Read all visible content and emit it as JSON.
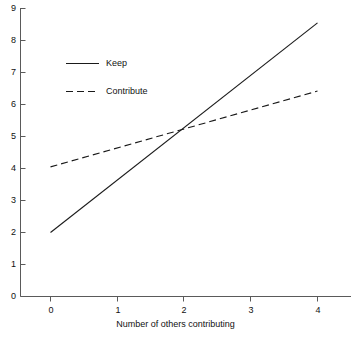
{
  "chart_data": {
    "type": "line",
    "title": "",
    "subtitle": "",
    "xlabel": "Number of others contributing",
    "ylabel": "",
    "x": [
      0,
      1,
      2,
      3,
      4
    ],
    "xlim": [
      -0.35,
      4.35
    ],
    "ylim": [
      0,
      9
    ],
    "xticks": [
      "0",
      "1",
      "2",
      "3",
      "4"
    ],
    "yticks": [
      "0",
      "1",
      "2",
      "3",
      "4",
      "5",
      "6",
      "7",
      "8",
      "9"
    ],
    "grid": false,
    "legend_position": "upper left",
    "series": [
      {
        "name": "Keep",
        "style": "solid",
        "color": "#1a1a1a",
        "x": [
          0,
          4
        ],
        "values": [
          2.0,
          8.55
        ]
      },
      {
        "name": "Contribute",
        "style": "dashed",
        "color": "#1a1a1a",
        "x": [
          0,
          4
        ],
        "values": [
          4.05,
          6.42
        ]
      }
    ],
    "annotations": [],
    "intersection": {
      "x": 2.0,
      "y": 5.2
    }
  },
  "legend": {
    "entries": [
      {
        "label": "Keep",
        "style": "solid"
      },
      {
        "label": "Contribute",
        "style": "dashed"
      }
    ]
  },
  "axes": {
    "x_title": "Number of others contributing",
    "y_tick_labels": [
      "9",
      "8",
      "7",
      "6",
      "5",
      "4",
      "3",
      "2",
      "1",
      "0"
    ],
    "x_tick_labels": [
      "0",
      "1",
      "2",
      "3",
      "4"
    ]
  },
  "colors": {
    "axis": "#5a5a5a",
    "line": "#1a1a1a",
    "text": "#111111",
    "background": "#ffffff"
  }
}
